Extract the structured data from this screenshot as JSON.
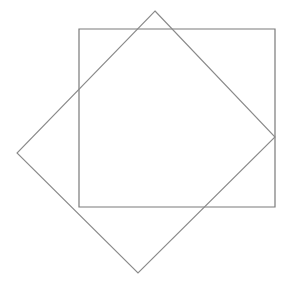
{
  "canvas": {
    "width": 289,
    "height": 289,
    "background_color": "#ffffff"
  },
  "chart_data": {
    "type": "diagram",
    "xlim": [
      0,
      289
    ],
    "ylim": [
      0,
      289
    ],
    "grid": false,
    "legend": null,
    "shapes": [
      {
        "name": "axis-aligned-square",
        "kind": "polygon",
        "closed": true,
        "points": [
          [
            79,
            29
          ],
          [
            275,
            29
          ],
          [
            275,
            207
          ],
          [
            79,
            207
          ]
        ],
        "width": 196,
        "height": 178,
        "rotation_deg": 0,
        "stroke": "#7a7a7a",
        "stroke_width": 1.2,
        "fill": "none"
      },
      {
        "name": "rotated-square",
        "kind": "polygon",
        "closed": true,
        "points": [
          [
            155,
            11
          ],
          [
            275,
            137
          ],
          [
            138,
            273
          ],
          [
            17,
            153
          ]
        ],
        "rotation_deg": 45,
        "stroke": "#8a8a8a",
        "stroke_width": 1.1,
        "fill": "none"
      }
    ]
  }
}
